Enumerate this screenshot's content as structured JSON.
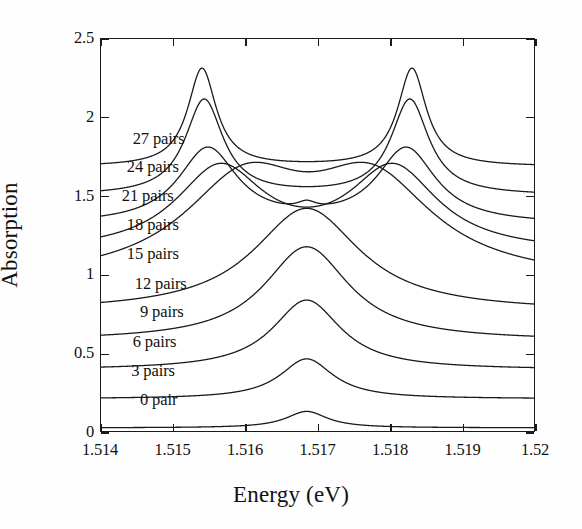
{
  "figure": {
    "background_color": "#ffffff",
    "line_color": "#1a1a1a",
    "text_color": "#111111"
  },
  "axes": {
    "x_title": "Energy (eV)",
    "y_title": "Absorption",
    "x_ticks": [
      "1.514",
      "1.515",
      "1.516",
      "1.517",
      "1.518",
      "1.519",
      "1.52"
    ],
    "x_tick_values": [
      1.514,
      1.515,
      1.516,
      1.517,
      1.518,
      1.519,
      1.52
    ],
    "y_ticks": [
      "0",
      "0.5",
      "1",
      "1.5",
      "2",
      "2.5"
    ],
    "y_tick_values": [
      0,
      0.5,
      1,
      1.5,
      2,
      2.5
    ]
  },
  "chart_data": {
    "type": "line",
    "title": "",
    "subtitle": "",
    "xlabel": "Energy (eV)",
    "ylabel": "Absorption",
    "xlim": [
      1.514,
      1.52
    ],
    "ylim": [
      0,
      2.5
    ],
    "grid": false,
    "legend_position": "inline-left-labels",
    "annotations": [
      "27 pairs",
      "24 pairs",
      "21 pairs",
      "18 pairs",
      "15 pairs",
      "12 pairs",
      "9 pairs",
      "6 pairs",
      "3 pairs",
      "0 pair"
    ],
    "series": [
      {
        "name": "0 pair",
        "label": "0 pair",
        "baseline": 0.02,
        "peaks": [
          {
            "center": 1.51685,
            "height": 0.105,
            "hwhm": 0.00035
          }
        ]
      },
      {
        "name": "3 pairs",
        "label": "3 pairs",
        "baseline": 0.205,
        "peaks": [
          {
            "center": 1.51685,
            "height": 0.255,
            "hwhm": 0.00045
          }
        ]
      },
      {
        "name": "6 pairs",
        "label": "6 pairs",
        "baseline": 0.39,
        "peaks": [
          {
            "center": 1.51685,
            "height": 0.445,
            "hwhm": 0.00058
          }
        ]
      },
      {
        "name": "9 pairs",
        "label": "9 pairs",
        "baseline": 0.575,
        "peaks": [
          {
            "center": 1.51685,
            "height": 0.6,
            "hwhm": 0.00072
          }
        ]
      },
      {
        "name": "12 pairs",
        "label": "12 pairs",
        "baseline": 0.76,
        "peaks": [
          {
            "center": 1.51685,
            "height": 0.66,
            "hwhm": 0.0009
          }
        ]
      },
      {
        "name": "15 pairs",
        "label": "15 pairs",
        "baseline": 0.945,
        "peaks": [
          {
            "center": 1.516,
            "height": 0.6,
            "hwhm": 0.00105
          },
          {
            "center": 1.51775,
            "height": 0.6,
            "hwhm": 0.00105
          }
        ]
      },
      {
        "name": "18 pairs",
        "label": "18 pairs",
        "baseline": 1.13,
        "peaks": [
          {
            "center": 1.51565,
            "height": 0.53,
            "hwhm": 0.00075
          },
          {
            "center": 1.51805,
            "height": 0.53,
            "hwhm": 0.00075
          }
        ]
      },
      {
        "name": "21 pairs",
        "label": "21 pairs",
        "baseline": 1.315,
        "peaks": [
          {
            "center": 1.51548,
            "height": 0.48,
            "hwhm": 0.0005
          },
          {
            "center": 1.51823,
            "height": 0.48,
            "hwhm": 0.0005
          },
          {
            "center": 1.51685,
            "height": 0.045,
            "hwhm": 0.00016
          }
        ]
      },
      {
        "name": "24 pairs",
        "label": "24 pairs",
        "baseline": 1.5,
        "peaks": [
          {
            "center": 1.51543,
            "height": 0.61,
            "hwhm": 0.00032
          },
          {
            "center": 1.51828,
            "height": 0.61,
            "hwhm": 0.00032
          }
        ]
      },
      {
        "name": "27 pairs",
        "label": "27 pairs",
        "baseline": 1.685,
        "peaks": [
          {
            "center": 1.5154,
            "height": 0.625,
            "hwhm": 0.00024
          },
          {
            "center": 1.51831,
            "height": 0.625,
            "hwhm": 0.00024
          }
        ]
      }
    ]
  },
  "curve_labels": [
    {
      "text": "27 pairs",
      "x": 1.51445,
      "y": 1.855
    },
    {
      "text": "24 pairs",
      "x": 1.51437,
      "y": 1.672
    },
    {
      "text": "21 pairs",
      "x": 1.5143,
      "y": 1.492
    },
    {
      "text": "18 pairs",
      "x": 1.51437,
      "y": 1.308
    },
    {
      "text": "15 pairs",
      "x": 1.51437,
      "y": 1.123
    },
    {
      "text": "12 pairs",
      "x": 1.51448,
      "y": 0.935
    },
    {
      "text": "9 pairs",
      "x": 1.51455,
      "y": 0.752
    },
    {
      "text": "6 pairs",
      "x": 1.51445,
      "y": 0.567
    },
    {
      "text": "3 pairs",
      "x": 1.51443,
      "y": 0.382
    },
    {
      "text": "0 pair",
      "x": 1.51455,
      "y": 0.196
    }
  ]
}
